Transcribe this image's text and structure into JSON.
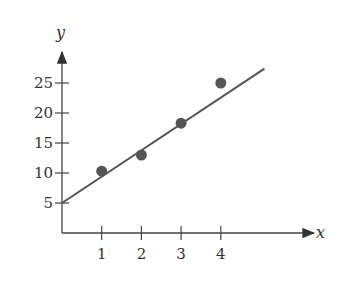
{
  "chart_data": {
    "type": "scatter",
    "title": "",
    "xlabel": "x",
    "ylabel": "y",
    "x": [
      1,
      2,
      3,
      4
    ],
    "y": [
      10.3,
      13,
      18.3,
      25
    ],
    "series": [
      {
        "name": "data points",
        "x": [
          1,
          2,
          3,
          4
        ],
        "values": [
          10.3,
          13,
          18.3,
          25
        ]
      },
      {
        "name": "fit line",
        "type": "line",
        "x": [
          0,
          5.1
        ],
        "values": [
          5,
          27.4
        ]
      }
    ],
    "xticks": [
      "1",
      "2",
      "3",
      "4"
    ],
    "yticks": [
      "5",
      "10",
      "15",
      "20",
      "25"
    ],
    "xlim": [
      0,
      6.4
    ],
    "ylim": [
      0,
      30
    ],
    "grid": false,
    "legend": "none"
  },
  "colors": {
    "axis": "#444444",
    "point": "#555555",
    "line": "#555555"
  }
}
